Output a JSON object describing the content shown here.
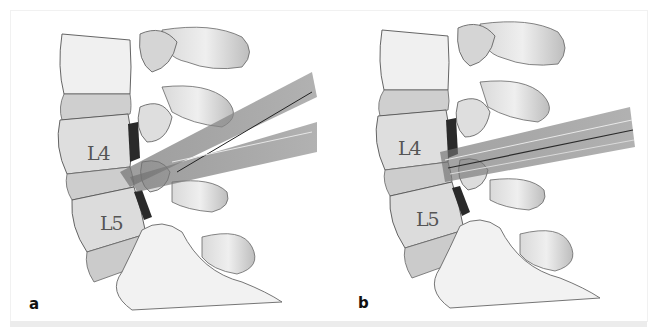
{
  "figure": {
    "panels": [
      {
        "id": "a",
        "label": "a",
        "vertebra_labels": [
          "L4",
          "L5"
        ],
        "instrument": "diverging-tubes"
      },
      {
        "id": "b",
        "label": "b",
        "vertebra_labels": [
          "L4",
          "L5"
        ],
        "instrument": "parallel-tube"
      }
    ],
    "colors": {
      "bone": "#e6e6e6",
      "bone_shadow": "#a9a9a9",
      "outline": "#555555",
      "disc_dark": "#2a2a2a",
      "tube": "#8a8a8a",
      "background": "#ffffff"
    }
  }
}
